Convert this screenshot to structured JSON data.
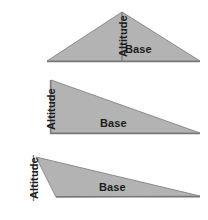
{
  "figure": {
    "background_color": "#ffffff",
    "fill_color": "#b3b3b3",
    "stroke_color": "#8c8c8c",
    "line_color": "#777777",
    "label_color": "#1c1c1c",
    "diagrams": [
      {
        "id": "acute-triangle",
        "description": "Acute triangle with interior altitude from apex to base",
        "altitude_label": "Altitude",
        "base_label": "Base",
        "altitude_position": "interior",
        "vertices": "47,61 122,12 200,61",
        "altitude_from": "122,12",
        "altitude_to": "122,61",
        "base_from": "47,61",
        "base_to": "200,61"
      },
      {
        "id": "right-triangle",
        "description": "Right triangle with altitude as the left vertical leg",
        "altitude_label": "Altitude",
        "base_label": "Base",
        "altitude_position": "leg",
        "vertices": "51,80 51,133 200,133",
        "altitude_from": "51,80",
        "altitude_to": "51,133",
        "base_from": "51,133",
        "base_to": "200,133"
      },
      {
        "id": "obtuse-triangle",
        "description": "Obtuse triangle with exterior altitude falling outside the base",
        "altitude_label": "Altitude",
        "base_label": "Base",
        "altitude_position": "exterior",
        "vertices": "36,157 200,196 56,197",
        "altitude_from": "33,155",
        "altitude_to": "33,200",
        "base_from": "56,197",
        "base_to": "200,197"
      }
    ]
  }
}
